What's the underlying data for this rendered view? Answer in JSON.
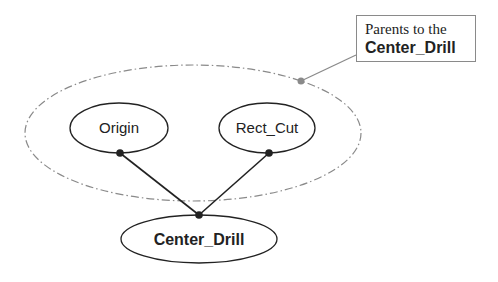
{
  "diagram": {
    "group": {
      "label": "parent-group",
      "stroke_color": "#8a8a8a",
      "style": "dash-dot"
    },
    "nodes": [
      {
        "id": "origin",
        "label": "Origin",
        "bold": false
      },
      {
        "id": "rect_cut",
        "label": "Rect_Cut",
        "bold": false
      },
      {
        "id": "center_drill",
        "label": "Center_Drill",
        "bold": true
      }
    ],
    "edges": [
      {
        "from": "origin",
        "to": "center_drill"
      },
      {
        "from": "rect_cut",
        "to": "center_drill"
      }
    ],
    "callout": {
      "line1": "Parents to the",
      "line2": "Center_Drill",
      "leader_color": "#8a8a8a"
    },
    "colors": {
      "node_stroke": "#222222",
      "edge": "#222222",
      "group_stroke": "#8a8a8a"
    }
  }
}
